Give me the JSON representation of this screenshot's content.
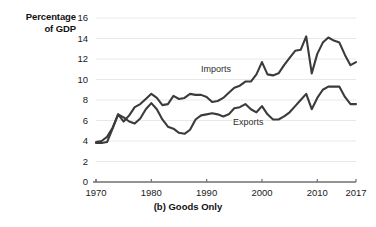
{
  "chart_data": {
    "type": "line",
    "title": "",
    "caption": "(b) Goods Only",
    "ylabel_line1": "Percentage",
    "ylabel_line2": "of GDP",
    "xlabel": "",
    "ylim": [
      0,
      16
    ],
    "xlim": [
      1970,
      2017
    ],
    "yticks": [
      0,
      2,
      4,
      6,
      8,
      10,
      12,
      14,
      16
    ],
    "xticks": [
      1970,
      1980,
      1990,
      2000,
      2010,
      2017
    ],
    "grid": "horizontal",
    "legend_position": "inline-annotations",
    "line_color": "#3b3b3b",
    "grid_color": "#e8e8e8",
    "axis_color": "#6f6f6f",
    "x": [
      1970,
      1971,
      1972,
      1973,
      1974,
      1975,
      1976,
      1977,
      1978,
      1979,
      1980,
      1981,
      1982,
      1983,
      1984,
      1985,
      1986,
      1987,
      1988,
      1989,
      1990,
      1991,
      1992,
      1993,
      1994,
      1995,
      1996,
      1997,
      1998,
      1999,
      2000,
      2001,
      2002,
      2003,
      2004,
      2005,
      2006,
      2007,
      2008,
      2009,
      2010,
      2011,
      2012,
      2013,
      2014,
      2015,
      2016,
      2017
    ],
    "series": [
      {
        "name": "Imports",
        "label": "Imports",
        "values": [
          3.9,
          4.0,
          4.4,
          5.3,
          6.6,
          5.9,
          6.5,
          7.3,
          7.6,
          8.1,
          8.6,
          8.2,
          7.5,
          7.6,
          8.4,
          8.1,
          8.2,
          8.6,
          8.5,
          8.5,
          8.3,
          7.8,
          7.9,
          8.2,
          8.7,
          9.2,
          9.4,
          9.8,
          9.8,
          10.5,
          11.7,
          10.5,
          10.4,
          10.6,
          11.4,
          12.1,
          12.8,
          12.9,
          14.2,
          10.6,
          12.5,
          13.6,
          14.1,
          13.8,
          13.6,
          12.4,
          11.4,
          11.7
        ],
        "max": 14.2,
        "max_year": 2008,
        "min": 3.9,
        "min_year": 1970,
        "last": 11.7
      },
      {
        "name": "Exports",
        "label": "Exports",
        "values": [
          3.8,
          3.8,
          3.9,
          5.2,
          6.6,
          6.3,
          5.9,
          5.7,
          6.2,
          7.1,
          7.7,
          7.1,
          6.1,
          5.4,
          5.2,
          4.8,
          4.7,
          5.1,
          6.1,
          6.5,
          6.6,
          6.7,
          6.6,
          6.4,
          6.6,
          7.2,
          7.3,
          7.6,
          7.1,
          6.8,
          7.4,
          6.6,
          6.1,
          6.1,
          6.4,
          6.8,
          7.4,
          8.0,
          8.6,
          7.1,
          8.2,
          9.0,
          9.3,
          9.3,
          9.3,
          8.3,
          7.6,
          7.6
        ],
        "max": 9.3,
        "max_year": 2012,
        "min": 3.8,
        "min_year": 1970,
        "last": 7.6
      }
    ]
  }
}
